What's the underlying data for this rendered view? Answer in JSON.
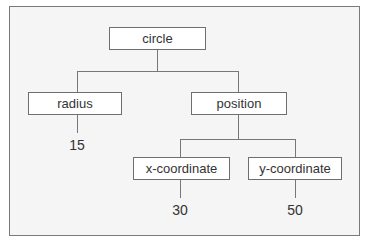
{
  "diagram": {
    "type": "tree",
    "nodes": {
      "root": {
        "label": "circle"
      },
      "radius": {
        "label": "radius"
      },
      "position": {
        "label": "position"
      },
      "x": {
        "label": "x-coordinate"
      },
      "y": {
        "label": "y-coordinate"
      }
    },
    "leaves": {
      "radius_value": "15",
      "x_value": "30",
      "y_value": "50"
    },
    "edges": [
      [
        "circle",
        "radius"
      ],
      [
        "circle",
        "position"
      ],
      [
        "radius",
        "15"
      ],
      [
        "position",
        "x-coordinate"
      ],
      [
        "position",
        "y-coordinate"
      ],
      [
        "x-coordinate",
        "30"
      ],
      [
        "y-coordinate",
        "50"
      ]
    ]
  }
}
